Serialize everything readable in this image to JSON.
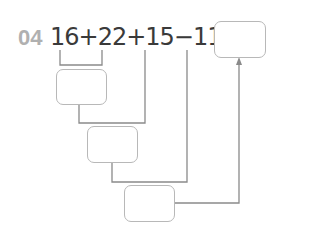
{
  "problem": {
    "number": "04",
    "expression": "16+22+15−11=",
    "terms": [
      "16",
      "22",
      "15",
      "11"
    ],
    "operators": [
      "+",
      "+",
      "−",
      "="
    ]
  },
  "answer_boxes": [
    {
      "id": "final",
      "value": ""
    },
    {
      "id": "step1",
      "value": ""
    },
    {
      "id": "step2",
      "value": ""
    },
    {
      "id": "step3",
      "value": ""
    }
  ],
  "colors": {
    "number": "#b0b0b0",
    "text": "#3a3a3a",
    "lines": "#8a8a8a",
    "box_border": "#b8b8b8"
  }
}
